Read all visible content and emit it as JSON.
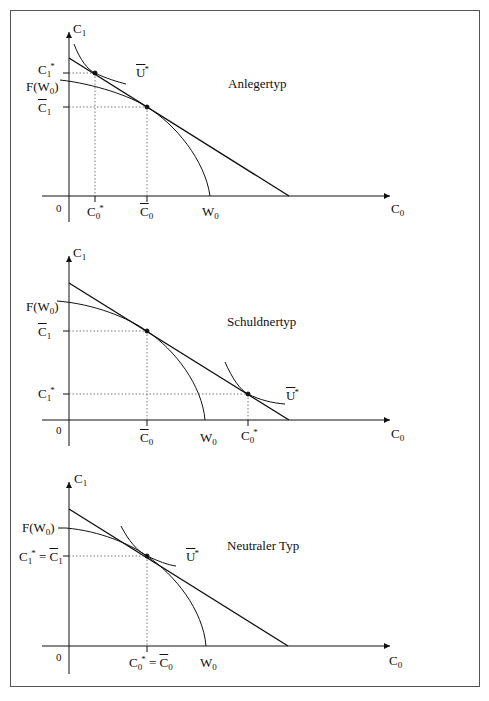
{
  "figure": {
    "panels": [
      {
        "title": "Anlegertyp",
        "y_axis_label": "C1",
        "x_axis_label": "C0",
        "origin_label": "0",
        "y_ticks": [
          {
            "label": "C1*",
            "role": "optimal_consumption_t1"
          },
          {
            "label": "F(W0)",
            "role": "production_frontier_intercept"
          },
          {
            "label": "C̄1",
            "role": "production_optimum_t1"
          }
        ],
        "x_ticks": [
          {
            "label": "C0*",
            "role": "optimal_consumption_t0"
          },
          {
            "label": "C̄0",
            "role": "production_optimum_t0"
          },
          {
            "label": "W0",
            "role": "initial_wealth"
          }
        ],
        "curve_labels": [
          {
            "label": "Ū*",
            "role": "indifference_curve"
          }
        ]
      },
      {
        "title": "Schuldnertyp",
        "y_axis_label": "C1",
        "x_axis_label": "C0",
        "origin_label": "0",
        "y_ticks": [
          {
            "label": "F(W0)",
            "role": "production_frontier_intercept"
          },
          {
            "label": "C̄1",
            "role": "production_optimum_t1"
          },
          {
            "label": "C1*",
            "role": "optimal_consumption_t1"
          }
        ],
        "x_ticks": [
          {
            "label": "C̄0",
            "role": "production_optimum_t0"
          },
          {
            "label": "W0",
            "role": "initial_wealth"
          },
          {
            "label": "C0*",
            "role": "optimal_consumption_t0"
          }
        ],
        "curve_labels": [
          {
            "label": "Ū*",
            "role": "indifference_curve"
          }
        ]
      },
      {
        "title": "Neutraler Typ",
        "y_axis_label": "C1",
        "x_axis_label": "C0",
        "origin_label": "0",
        "y_ticks": [
          {
            "label": "F(W0)",
            "role": "production_frontier_intercept"
          },
          {
            "label": "C1* = C̄1",
            "role": "optimum_t1"
          }
        ],
        "x_ticks": [
          {
            "label": "C0* = C̄0",
            "role": "optimum_t0"
          },
          {
            "label": "W0",
            "role": "initial_wealth"
          }
        ],
        "curve_labels": [
          {
            "label": "Ū*",
            "role": "indifference_curve"
          }
        ]
      }
    ]
  },
  "text": {
    "p1_title": "Anlegertyp",
    "p2_title": "Schuldnertyp",
    "p3_title": "Neutraler Typ",
    "C": "C",
    "F": "F(W",
    "paren": ")",
    "W": "W",
    "U": "U",
    "zero": "0",
    "one": "1",
    "star": "*",
    "eq": " = "
  }
}
